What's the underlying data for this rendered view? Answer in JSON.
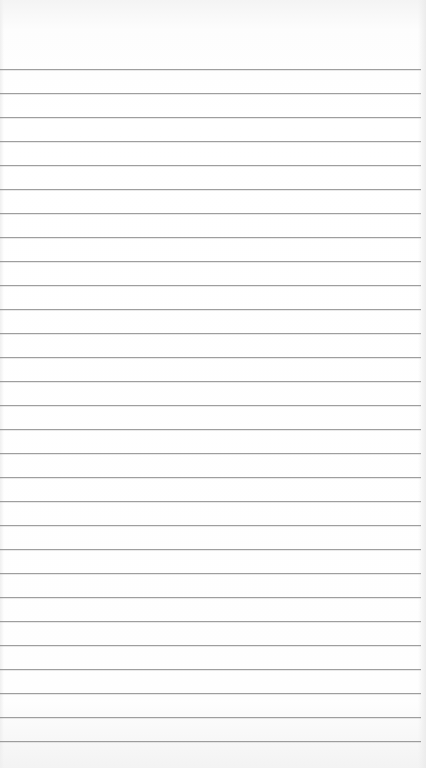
{
  "paper": {
    "type": "ruled notepad sheet",
    "line_color": "#8e8e8e",
    "background_color": "#ffffff",
    "first_line_y": 69,
    "line_spacing": 24,
    "line_count": 29
  }
}
